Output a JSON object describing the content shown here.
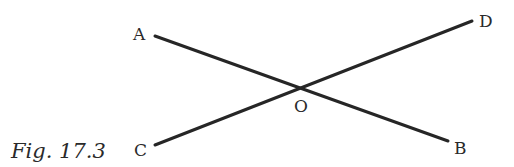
{
  "figure": {
    "caption": "Fig. 17.3",
    "points": {
      "A": {
        "label": "A",
        "x": 155,
        "y": 36
      },
      "B": {
        "label": "B",
        "x": 448,
        "y": 141
      },
      "C": {
        "label": "C",
        "x": 155,
        "y": 145
      },
      "D": {
        "label": "D",
        "x": 472,
        "y": 21
      },
      "O": {
        "label": "O",
        "x": 299,
        "y": 87
      }
    },
    "segments": [
      {
        "name": "AB",
        "from": "A",
        "to": "B"
      },
      {
        "name": "CD",
        "from": "C",
        "to": "D"
      }
    ],
    "line_color": "#262626"
  }
}
